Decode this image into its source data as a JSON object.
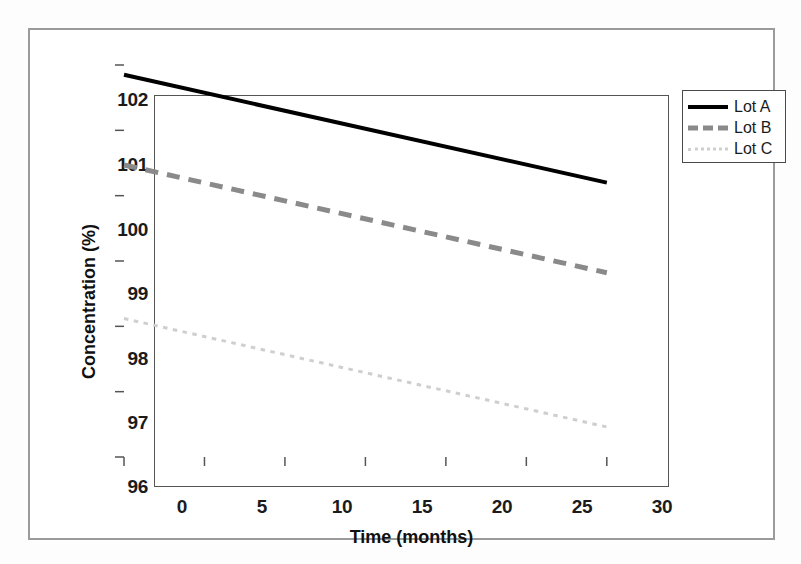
{
  "figure": {
    "background_color": "#ffffff",
    "frame_color": "#9b9b9b"
  },
  "chart_data": {
    "type": "line",
    "title": "",
    "subtitle": "",
    "xlabel": "Time (months)",
    "ylabel": "Concentration (%)",
    "xlim": [
      0,
      32
    ],
    "ylim": [
      96,
      102
    ],
    "xticks": [
      0,
      5,
      10,
      15,
      20,
      25,
      30
    ],
    "xtick_labels": [
      "0",
      "5",
      "10",
      "15",
      "20",
      "25",
      "30"
    ],
    "yticks": [
      96,
      97,
      98,
      99,
      100,
      101,
      102
    ],
    "ytick_labels": [
      "96",
      "97",
      "98",
      "99",
      "100",
      "101",
      "102"
    ],
    "grid": false,
    "legend_position": "outside-top-right",
    "x": [
      0,
      30
    ],
    "series": [
      {
        "name": "Lot A",
        "values": [
          101.85,
          100.2
        ],
        "color": "#000000",
        "linestyle": "solid",
        "linewidth": 4
      },
      {
        "name": "Lot B",
        "values": [
          100.47,
          98.82
        ],
        "color": "#8a8a8a",
        "linestyle": "dashed",
        "linewidth": 5
      },
      {
        "name": "Lot C",
        "values": [
          98.12,
          96.46
        ],
        "color": "#cfcfcf",
        "linestyle": "dotted",
        "linewidth": 3
      }
    ]
  },
  "legend": {
    "entries": [
      {
        "label": "Lot A"
      },
      {
        "label": "Lot B"
      },
      {
        "label": "Lot C"
      }
    ]
  }
}
